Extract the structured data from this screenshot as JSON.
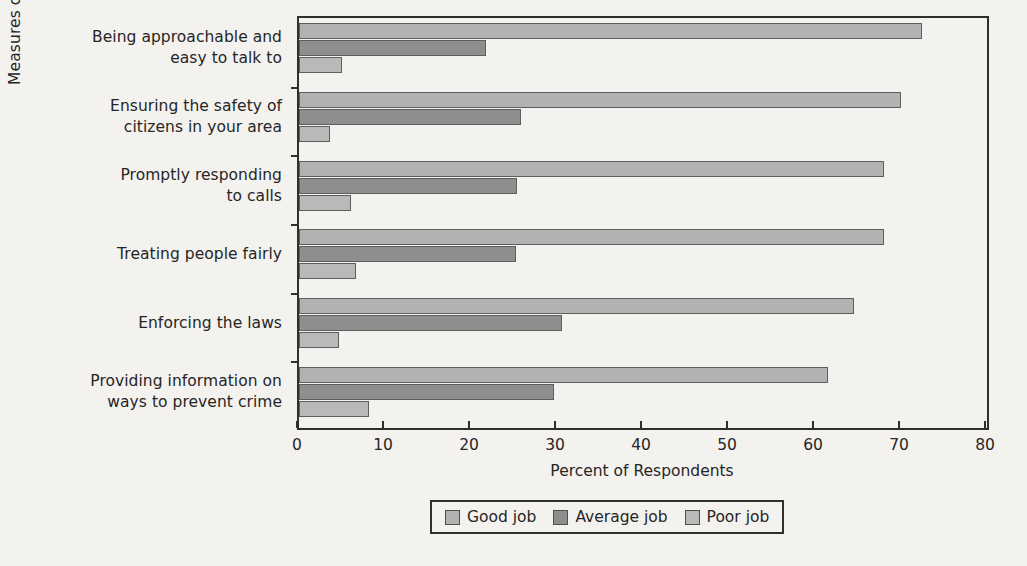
{
  "chart_data": {
    "type": "bar",
    "orientation": "horizontal",
    "title": "",
    "xlabel": "Percent of Respondents",
    "ylabel": "Measures of Police Performance",
    "xlim": [
      0,
      80
    ],
    "xticks": [
      0,
      10,
      20,
      30,
      40,
      50,
      60,
      70,
      80
    ],
    "xtick_labels": [
      "0",
      "10",
      "20",
      "30",
      "40",
      "50",
      "60",
      "70",
      "80"
    ],
    "grid": false,
    "legend_position": "bottom",
    "categories": [
      "Being approachable and easy to talk to",
      "Ensuring the safety of citizens in your area",
      "Promptly responding to calls",
      "Treating people fairly",
      "Enforcing the laws",
      "Providing information on ways to prevent crime"
    ],
    "category_label_lines": [
      [
        "Being approachable and",
        "easy to talk to"
      ],
      [
        "Ensuring the safety of",
        "citizens in your area"
      ],
      [
        "Promptly responding",
        "to calls"
      ],
      [
        "Treating people fairly"
      ],
      [
        "Enforcing the laws"
      ],
      [
        "Providing information on",
        "ways to prevent crime"
      ]
    ],
    "series": [
      {
        "name": "Good job",
        "color": "#b2b2b2",
        "values": [
          72.4,
          70.0,
          68.0,
          68.0,
          64.5,
          61.5
        ]
      },
      {
        "name": "Average job",
        "color": "#8e8e8e",
        "values": [
          21.8,
          25.8,
          25.3,
          25.2,
          30.6,
          29.7
        ]
      },
      {
        "name": "Poor job",
        "color": "#b9b9b9",
        "values": [
          5.0,
          3.6,
          6.0,
          6.6,
          4.6,
          8.1
        ]
      }
    ]
  },
  "legend": {
    "items": [
      {
        "label": "Good job",
        "color": "#b2b2b2"
      },
      {
        "label": "Average job",
        "color": "#8e8e8e"
      },
      {
        "label": "Poor job",
        "color": "#b9b9b9"
      }
    ]
  }
}
